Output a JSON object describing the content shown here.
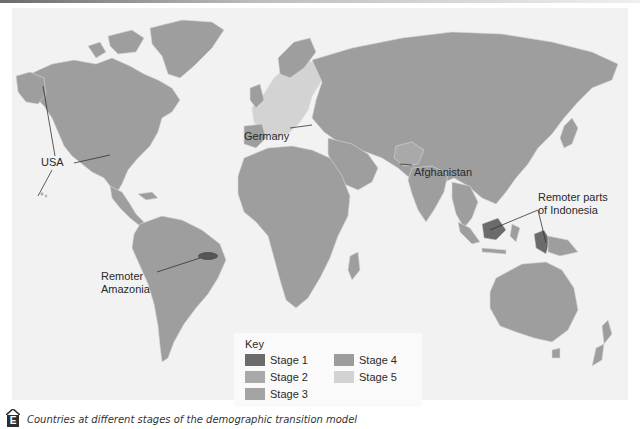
{
  "figure": {
    "caption_marker": "E",
    "caption": "Countries at different stages of the demographic transition model"
  },
  "colors": {
    "background_panel": "#f2f2f2",
    "stage1": "#6b6b6b",
    "stage2": "#a9a9a9",
    "stage3": "#a4a4a4",
    "stage4": "#9c9c9c",
    "stage5": "#d3d3d3",
    "land_default": "#9e9e9e",
    "border": "#d9d9d9"
  },
  "annotations": {
    "usa": "USA",
    "germany": "Germany",
    "afghanistan": "Afghanistan",
    "indonesia_line1": "Remoter parts",
    "indonesia_line2": "of Indonesia",
    "amazonia_line1": "Remoter",
    "amazonia_line2": "Amazonia"
  },
  "key": {
    "title": "Key",
    "items": [
      {
        "label": "Stage 1",
        "color": "#6b6b6b"
      },
      {
        "label": "Stage 2",
        "color": "#a9a9a9"
      },
      {
        "label": "Stage 3",
        "color": "#a4a4a4"
      },
      {
        "label": "Stage 4",
        "color": "#9c9c9c"
      },
      {
        "label": "Stage 5",
        "color": "#d3d3d3"
      }
    ]
  },
  "regions": [
    {
      "name": "USA",
      "stage": "Stage 4"
    },
    {
      "name": "Germany",
      "stage": "Stage 5"
    },
    {
      "name": "Afghanistan",
      "stage": "Stage 2"
    },
    {
      "name": "Remoter parts of Indonesia",
      "stage": "Stage 1"
    },
    {
      "name": "Remoter Amazonia",
      "stage": "Stage 1"
    }
  ]
}
